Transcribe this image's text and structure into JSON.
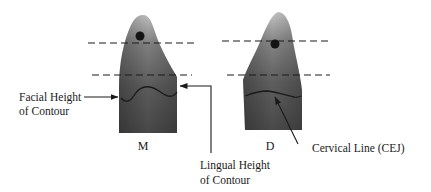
{
  "diagram": {
    "views": [
      {
        "id": "mesial",
        "label": "M"
      },
      {
        "id": "distal",
        "label": "D"
      }
    ],
    "labels": {
      "facial_height_of_contour": [
        "Facial Height",
        "of Contour"
      ],
      "lingual_height_of_contour": [
        "Lingual Height",
        "of Contour"
      ],
      "cervical_line": "Cervical Line (CEJ)"
    },
    "colors": {
      "tooth_dark": "#4a4a4a",
      "tooth_mid": "#7a7a7a",
      "tooth_light": "#b5b5b5",
      "line": "#1a1a1a",
      "background": "#ffffff"
    }
  }
}
